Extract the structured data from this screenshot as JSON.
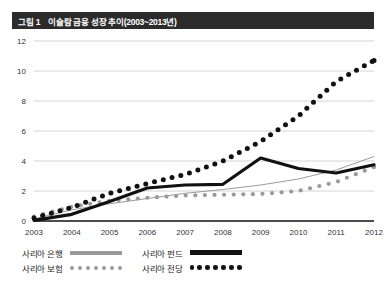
{
  "figure": {
    "index_label": "그림 1",
    "title": "이슬람 금융 성장 추이(2003~2013년)"
  },
  "legend": {
    "entries": [
      {
        "label": "사리아 은행",
        "style": "thin-gray-line",
        "color": "#9a9a9a"
      },
      {
        "label": "사리아 펀드",
        "style": "thick-black-line",
        "color": "#111111"
      },
      {
        "label": "사리아 보험",
        "style": "light-gray-dots",
        "color": "#9a9a9a"
      },
      {
        "label": "사리아 전당",
        "style": "bold-black-dots",
        "color": "#111111"
      }
    ]
  },
  "chart_data": {
    "type": "line",
    "title": "이슬람 금융 성장 추이(2003~2013년)",
    "xlabel": "",
    "ylabel": "",
    "x": [
      2003,
      2004,
      2005,
      2006,
      2007,
      2008,
      2009,
      2010,
      2011,
      2012
    ],
    "xtick_labels": [
      "2003",
      "2004",
      "2005",
      "2006",
      "2007",
      "2008",
      "2009",
      "2010",
      "2011",
      "2012"
    ],
    "ytick_labels": [
      "0",
      "2",
      "4",
      "6",
      "8",
      "10",
      "12"
    ],
    "yticks": [
      0,
      2,
      4,
      6,
      8,
      10,
      12
    ],
    "ylim": [
      0,
      12
    ],
    "grid": "horizontal",
    "legend_position": "bottom-left",
    "series": [
      {
        "name": "사리아 은행",
        "style": "thin-gray-line",
        "color": "#9a9a9a",
        "values": [
          0.15,
          0.75,
          1.15,
          1.5,
          1.85,
          2.1,
          2.4,
          2.8,
          3.4,
          4.3
        ]
      },
      {
        "name": "사리아 펀드",
        "style": "thick-black-line",
        "color": "#111111",
        "values": [
          0.05,
          0.45,
          1.3,
          2.2,
          2.4,
          2.45,
          4.2,
          3.5,
          3.2,
          3.75
        ]
      },
      {
        "name": "사리아 보험",
        "style": "light-gray-dots",
        "color": "#9a9a9a",
        "values": [
          0.3,
          0.95,
          1.35,
          1.55,
          1.7,
          1.75,
          1.8,
          2.0,
          2.6,
          3.6
        ]
      },
      {
        "name": "사리아 전당",
        "style": "bold-black-dots",
        "color": "#111111",
        "values": [
          0.2,
          0.9,
          1.85,
          2.5,
          3.1,
          4.0,
          5.3,
          7.0,
          9.3,
          10.7
        ]
      }
    ]
  }
}
